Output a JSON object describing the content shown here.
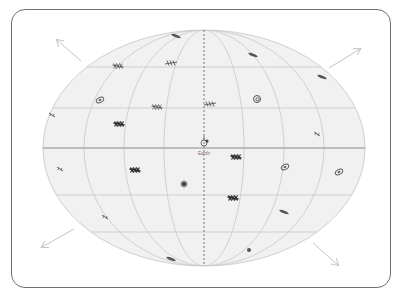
{
  "diagram": {
    "type": "all-sky map (Hammer/Aitoff projection)",
    "center_label": "Earth",
    "colors": {
      "frame": "#6f6f6f",
      "sky_fill": "#f1f1f1",
      "grid": "#c8c8c8",
      "equator": "#8a8a8a",
      "meridian_dashed": "#777777",
      "arrows": "#c4c4c4",
      "galaxy": "#555555",
      "galaxy_dark": "#2e2e2e"
    },
    "arrows": [
      {
        "name": "arrow-upper-left",
        "direction": "up-left"
      },
      {
        "name": "arrow-upper-right",
        "direction": "up-right"
      },
      {
        "name": "arrow-lower-left",
        "direction": "down-left"
      },
      {
        "name": "arrow-lower-right",
        "direction": "down-right"
      }
    ],
    "galaxies": [
      {
        "x": 176,
        "y": 36,
        "kind": "edge-on"
      },
      {
        "x": 118,
        "y": 66,
        "kind": "spiral"
      },
      {
        "x": 171,
        "y": 63,
        "kind": "irregular"
      },
      {
        "x": 253,
        "y": 55,
        "kind": "edge-on"
      },
      {
        "x": 322,
        "y": 77,
        "kind": "edge-on"
      },
      {
        "x": 100,
        "y": 100,
        "kind": "ring"
      },
      {
        "x": 157,
        "y": 107,
        "kind": "spiral"
      },
      {
        "x": 210,
        "y": 104,
        "kind": "irregular"
      },
      {
        "x": 257,
        "y": 99,
        "kind": "ring-spiral"
      },
      {
        "x": 52,
        "y": 115,
        "kind": "small"
      },
      {
        "x": 119,
        "y": 124,
        "kind": "spiral-dark"
      },
      {
        "x": 317,
        "y": 134,
        "kind": "small"
      },
      {
        "x": 236,
        "y": 157,
        "kind": "spiral-dark"
      },
      {
        "x": 60,
        "y": 169,
        "kind": "small"
      },
      {
        "x": 135,
        "y": 170,
        "kind": "spiral-dark"
      },
      {
        "x": 285,
        "y": 167,
        "kind": "ring"
      },
      {
        "x": 339,
        "y": 172,
        "kind": "ring"
      },
      {
        "x": 184,
        "y": 184,
        "kind": "star-dark"
      },
      {
        "x": 233,
        "y": 198,
        "kind": "spiral-dark"
      },
      {
        "x": 105,
        "y": 217,
        "kind": "small"
      },
      {
        "x": 284,
        "y": 212,
        "kind": "edge-on"
      },
      {
        "x": 249,
        "y": 250,
        "kind": "dot"
      },
      {
        "x": 171,
        "y": 259,
        "kind": "edge-on"
      }
    ]
  }
}
